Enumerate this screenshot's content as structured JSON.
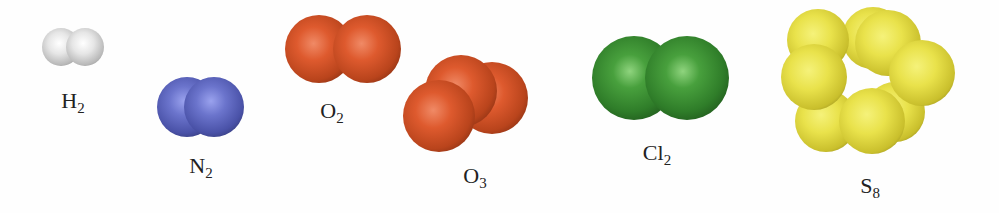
{
  "figure": {
    "molecules": [
      {
        "id": "h2",
        "element": "H",
        "subscript": "2",
        "color": "#e0e0e0"
      },
      {
        "id": "n2",
        "element": "N",
        "subscript": "2",
        "color": "#5a63b8"
      },
      {
        "id": "o2",
        "element": "O",
        "subscript": "2",
        "color": "#d9552a"
      },
      {
        "id": "o3",
        "element": "O",
        "subscript": "3",
        "color": "#d9552a"
      },
      {
        "id": "cl2",
        "element": "Cl",
        "subscript": "2",
        "color": "#3a8a33"
      },
      {
        "id": "s8",
        "element": "S",
        "subscript": "8",
        "color": "#e8e04a"
      }
    ]
  }
}
